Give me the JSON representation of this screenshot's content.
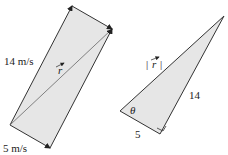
{
  "left_figure": {
    "side_label_long": "14 m/s",
    "side_label_short": "5 m/s",
    "resultant_label": "r"
  },
  "right_figure": {
    "hypotenuse_label": "|r|",
    "hyp_bar_left": "|",
    "hyp_letter": "r",
    "hyp_bar_right": "|",
    "long_leg_label": "14",
    "short_leg_label": "5",
    "angle_label": "θ"
  },
  "colors": {
    "fill": "#e6e6e6",
    "stroke": "#333333"
  }
}
